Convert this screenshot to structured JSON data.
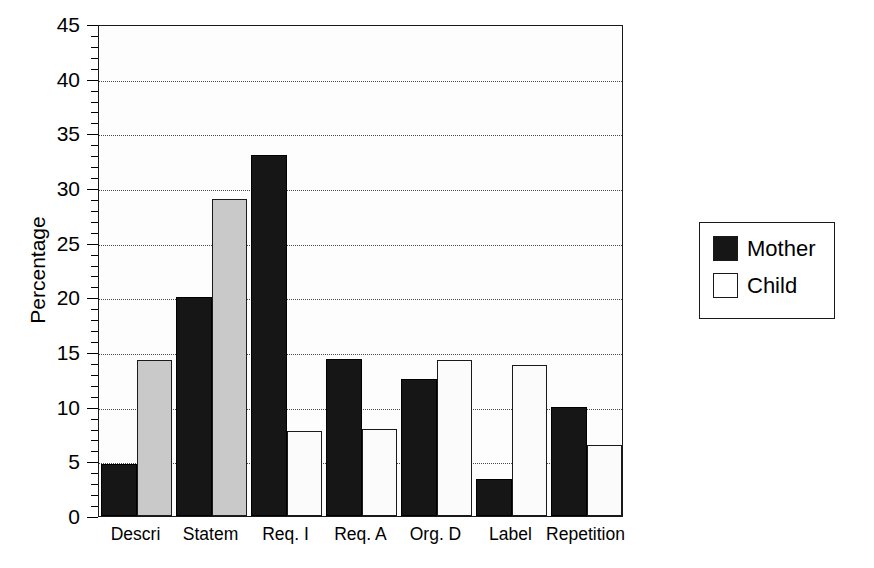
{
  "chart_data": {
    "type": "bar",
    "title": "",
    "subtitle": "",
    "xlabel": "",
    "ylabel": "Percentage",
    "ylim": [
      0,
      45
    ],
    "ytick_step": 5,
    "yminor_step": 1,
    "grid": "horizontal-dotted",
    "legend_position": "right-outside",
    "categories": [
      "Descri",
      "Statem",
      "Req. I",
      "Req. A",
      "Org. D",
      "Label",
      "Repetition"
    ],
    "ytick_labels": [
      "0",
      "5",
      "10",
      "15",
      "20",
      "25",
      "30",
      "35",
      "40",
      "45"
    ],
    "series": [
      {
        "name": "Mother",
        "fill": "#161616",
        "values": [
          4.8,
          20.0,
          33.0,
          14.4,
          12.5,
          3.4,
          10.0
        ]
      },
      {
        "name": "Child",
        "fill": "#ffffff",
        "values": [
          14.3,
          29.0,
          7.8,
          8.0,
          14.3,
          13.8,
          6.5
        ]
      }
    ]
  },
  "legend": {
    "entries": [
      {
        "label": "Mother"
      },
      {
        "label": "Child"
      }
    ]
  },
  "colors": {
    "axis": "#1a1a1a",
    "grid": "#4a4a4a",
    "mother": "#161616",
    "child": "#ffffff",
    "background": "#ffffff"
  }
}
